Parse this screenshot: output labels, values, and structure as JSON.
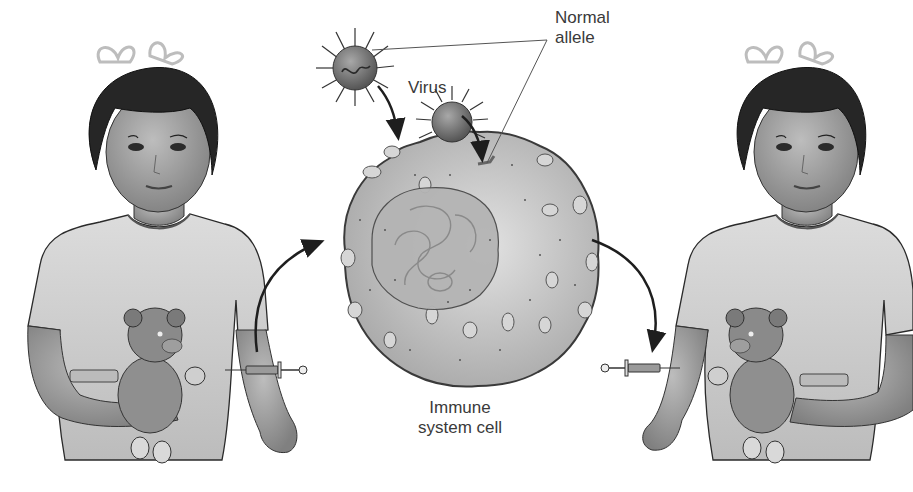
{
  "figure": {
    "palette": {
      "background": "#ffffff",
      "ink": "#1e1e1e",
      "label_text": "#3a3a3a",
      "cell_fill": "#c9c9c9",
      "nucleus_fill": "#b5b5b5",
      "virus_fill": "#7a7a7a",
      "skin": "#a8a8a8",
      "hair": "#2a2a2a",
      "shirt": "#d4d4d4"
    },
    "labels": {
      "virus": "Virus",
      "normal_allele_line1": "Normal",
      "normal_allele_line2": "allele",
      "immune_cell_line1": "Immune",
      "immune_cell_line2": "system cell"
    },
    "panels": [
      {
        "id": "left-child",
        "role": "patient before treatment — cells withdrawn via syringe"
      },
      {
        "id": "center-cell",
        "role": "immune system cell infected by virus carrying normal allele"
      },
      {
        "id": "right-child",
        "role": "patient receiving modified cells via syringe"
      }
    ],
    "arrows": [
      {
        "from": "left-syringe",
        "to": "immune-cell",
        "direction": "up-right"
      },
      {
        "from": "virus-1",
        "to": "immune-cell",
        "direction": "down"
      },
      {
        "from": "virus-2",
        "to": "cell-membrane",
        "direction": "down"
      },
      {
        "from": "immune-cell",
        "to": "right-syringe",
        "direction": "down-right"
      }
    ]
  }
}
